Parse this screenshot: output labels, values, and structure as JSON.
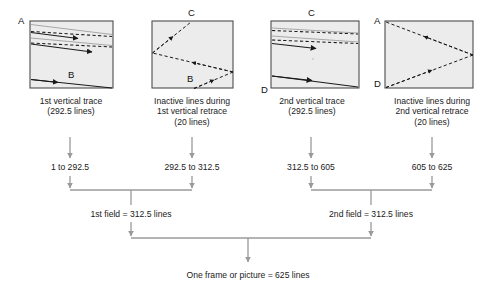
{
  "diagram": {
    "colors": {
      "box_fill": "#ececec",
      "box_stroke": "#4d4d4d",
      "trace_line": "#1a1a1a",
      "retrace_line": "#1a1a1a",
      "flow_line": "#9a9a9a",
      "text": "#1a1a1a"
    },
    "panels": [
      {
        "id": "panel-1st-vertical-trace",
        "corner_labels": [
          {
            "text": "A",
            "pos": "top-left"
          },
          {
            "text": "B",
            "pos": "bottom-inside"
          }
        ],
        "caption_lines": [
          "1st vertical trace",
          "(292.5 lines)"
        ]
      },
      {
        "id": "panel-1st-vertical-retrace",
        "corner_labels": [
          {
            "text": "C",
            "pos": "top-center"
          },
          {
            "text": "B",
            "pos": "bottom-inside"
          }
        ],
        "caption_lines": [
          "Inactive lines during",
          "1st vertical retrace",
          "(20 lines)"
        ]
      },
      {
        "id": "panel-2nd-vertical-trace",
        "corner_labels": [
          {
            "text": "C",
            "pos": "top-center"
          },
          {
            "text": "D",
            "pos": "bottom-left"
          }
        ],
        "caption_lines": [
          "2nd vertical trace",
          "(292.5 lines)"
        ]
      },
      {
        "id": "panel-2nd-vertical-retrace",
        "corner_labels": [
          {
            "text": "A",
            "pos": "top-left"
          },
          {
            "text": "D",
            "pos": "bottom-left"
          }
        ],
        "caption_lines": [
          "Inactive lines during",
          "2nd vertical retrace",
          "(20 lines)"
        ]
      }
    ],
    "line_ranges": [
      "1 to 292.5",
      "292.5 to 312.5",
      "312.5 to 605",
      "605 to 625"
    ],
    "field_labels": [
      "1st field = 312.5 lines",
      "2nd field = 312.5 lines"
    ],
    "frame_label": "One frame or picture = 625 lines"
  }
}
